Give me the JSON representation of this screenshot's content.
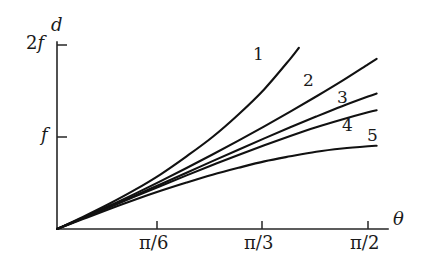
{
  "chart_data": {
    "type": "line",
    "title": "",
    "xlabel": "θ",
    "ylabel": "d",
    "x_tick_labels": [
      "π/6",
      "π/3",
      "π/2"
    ],
    "x_tick_values": [
      0.5235987756,
      1.0471975512,
      1.5707963268
    ],
    "y_tick_labels": [
      "f",
      "2f"
    ],
    "y_tick_values": [
      1,
      2
    ],
    "xlim": [
      0,
      1.7453292519
    ],
    "ylim": [
      0,
      2.18
    ],
    "grid": false,
    "legend": "inline-curve-labels",
    "series": [
      {
        "name": "1",
        "label": "1",
        "x": [
          0.0,
          0.1308996939,
          0.2617993878,
          0.3926990817,
          0.5235987756,
          0.6544984695,
          0.7853981634,
          0.9162978573,
          1.0471975512,
          1.1780972451,
          1.2217304764
        ],
        "y": [
          0.0,
          0.132,
          0.272,
          0.425,
          0.595,
          0.79,
          1.0,
          1.245,
          1.52,
          1.85,
          1.97
        ]
      },
      {
        "name": "2",
        "label": "2",
        "x": [
          0.0,
          0.1308996939,
          0.2617993878,
          0.3926990817,
          0.5235987756,
          0.6544984695,
          0.7853981634,
          0.9162978573,
          1.0471975512,
          1.1780972451,
          1.308996939,
          1.4398966329,
          1.5707963268,
          1.6144295581
        ],
        "y": [
          0.0,
          0.122,
          0.25,
          0.382,
          0.52,
          0.663,
          0.81,
          0.96,
          1.115,
          1.275,
          1.44,
          1.61,
          1.79,
          1.85
        ]
      },
      {
        "name": "3",
        "label": "3",
        "x": [
          0.0,
          0.1308996939,
          0.2617993878,
          0.3926990817,
          0.5235987756,
          0.6544984695,
          0.7853981634,
          0.9162978573,
          1.0471975512,
          1.1780972451,
          1.308996939,
          1.4398966329,
          1.5707963268,
          1.6144295581
        ],
        "y": [
          0.0,
          0.118,
          0.24,
          0.362,
          0.487,
          0.612,
          0.738,
          0.862,
          0.985,
          1.105,
          1.222,
          1.335,
          1.44,
          1.472
        ]
      },
      {
        "name": "4",
        "label": "4",
        "x": [
          0.0,
          0.1308996939,
          0.2617993878,
          0.3926990817,
          0.5235987756,
          0.6544984695,
          0.7853981634,
          0.9162978573,
          1.0471975512,
          1.1780972451,
          1.308996939,
          1.4398966329,
          1.5707963268,
          1.6144295581
        ],
        "y": [
          0.0,
          0.116,
          0.234,
          0.352,
          0.468,
          0.583,
          0.695,
          0.805,
          0.91,
          1.01,
          1.105,
          1.19,
          1.268,
          1.29
        ]
      },
      {
        "name": "5",
        "label": "5",
        "x": [
          0.0,
          0.1308996939,
          0.2617993878,
          0.3926990817,
          0.5235987756,
          0.6544984695,
          0.7853981634,
          0.9162978573,
          1.0471975512,
          1.1780972451,
          1.308996939,
          1.4398966329,
          1.5707963268,
          1.6144295581
        ],
        "y": [
          0.0,
          0.108,
          0.215,
          0.318,
          0.415,
          0.505,
          0.59,
          0.665,
          0.735,
          0.79,
          0.84,
          0.875,
          0.9,
          0.905
        ]
      }
    ]
  },
  "axes": {
    "y_axis_title": "d",
    "x_axis_title": "θ",
    "y_ticks": [
      {
        "id": "tick-2f",
        "prefix": "2",
        "symbol": "f"
      },
      {
        "id": "tick-f",
        "prefix": "",
        "symbol": "f"
      }
    ],
    "x_ticks": [
      {
        "id": "tick-pi-6",
        "numerator": "π",
        "denominator": "6",
        "text": "π/6"
      },
      {
        "id": "tick-pi-3",
        "numerator": "π",
        "denominator": "3",
        "text": "π/3"
      },
      {
        "id": "tick-pi-2",
        "numerator": "π",
        "denominator": "2",
        "text": "π/2"
      }
    ]
  },
  "curve_labels": [
    {
      "id": "curve-label-1",
      "text": "1"
    },
    {
      "id": "curve-label-2",
      "text": "2"
    },
    {
      "id": "curve-label-3",
      "text": "3"
    },
    {
      "id": "curve-label-4",
      "text": "4"
    },
    {
      "id": "curve-label-5",
      "text": "5"
    }
  ],
  "colors": {
    "curve": "#111111",
    "axis": "#262626",
    "background": "#ffffff",
    "text": "#1a1a1a"
  }
}
